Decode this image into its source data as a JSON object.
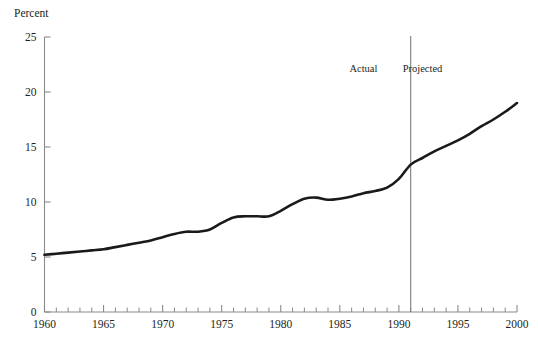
{
  "chart_data": {
    "type": "line",
    "title": "",
    "xlabel": "",
    "ylabel": "Percent",
    "xlim": [
      1960,
      2000
    ],
    "ylim": [
      0,
      25
    ],
    "grid": false,
    "legend": null,
    "y_ticks": [
      "0",
      "5",
      "10",
      "15",
      "20",
      "25"
    ],
    "y_tick_values": [
      0,
      5,
      10,
      15,
      20,
      25
    ],
    "x_ticks": [
      "1960",
      "1965",
      "1970",
      "1975",
      "1980",
      "1985",
      "1990",
      "1995",
      "2000"
    ],
    "x_tick_values": [
      1960,
      1965,
      1970,
      1975,
      1980,
      1985,
      1990,
      1995,
      2000
    ],
    "x_minor_tick_interval": 1,
    "series": [
      {
        "name": "Percent",
        "color": "#1a1a1a",
        "x": [
          1960,
          1961,
          1962,
          1963,
          1964,
          1965,
          1966,
          1967,
          1968,
          1969,
          1970,
          1971,
          1972,
          1973,
          1974,
          1975,
          1976,
          1977,
          1978,
          1979,
          1980,
          1981,
          1982,
          1983,
          1984,
          1985,
          1986,
          1987,
          1988,
          1989,
          1990,
          1991,
          1992,
          1993,
          1994,
          1995,
          1996,
          1997,
          1998,
          1999,
          2000
        ],
        "values": [
          5.2,
          5.3,
          5.4,
          5.5,
          5.6,
          5.7,
          5.9,
          6.1,
          6.3,
          6.5,
          6.8,
          7.1,
          7.3,
          7.3,
          7.5,
          8.1,
          8.6,
          8.7,
          8.7,
          8.7,
          9.2,
          9.8,
          10.3,
          10.4,
          10.2,
          10.3,
          10.5,
          10.8,
          11.0,
          11.3,
          12.1,
          13.4,
          14.0,
          14.6,
          15.1,
          15.6,
          16.2,
          16.9,
          17.5,
          18.2,
          19.0
        ]
      }
    ],
    "annotations": [
      {
        "name": "actual-label",
        "text": "Actual",
        "x": 1987.0,
        "y": 21.8
      },
      {
        "name": "projected-label",
        "text": "Projected",
        "x": 1992.0,
        "y": 21.8
      }
    ],
    "divider": {
      "x": 1991,
      "label_left": "Actual",
      "label_right": "Projected"
    }
  }
}
